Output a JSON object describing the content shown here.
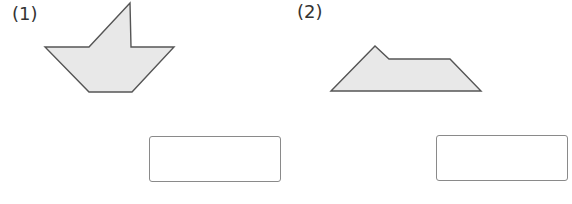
{
  "problems": [
    {
      "label": "(1)",
      "shape": {
        "name": "boat-shape",
        "points": "130,3 131,47 174,47 132,92 89,92 45,47 89,47",
        "fill": "#e8e8e8",
        "stroke": "#555555"
      },
      "answer": ""
    },
    {
      "label": "(2)",
      "shape": {
        "name": "trapezoid-notch-shape",
        "points": "331,91 375,46 389,59 450,59 481,91",
        "fill": "#e8e8e8",
        "stroke": "#555555"
      },
      "answer": ""
    }
  ]
}
